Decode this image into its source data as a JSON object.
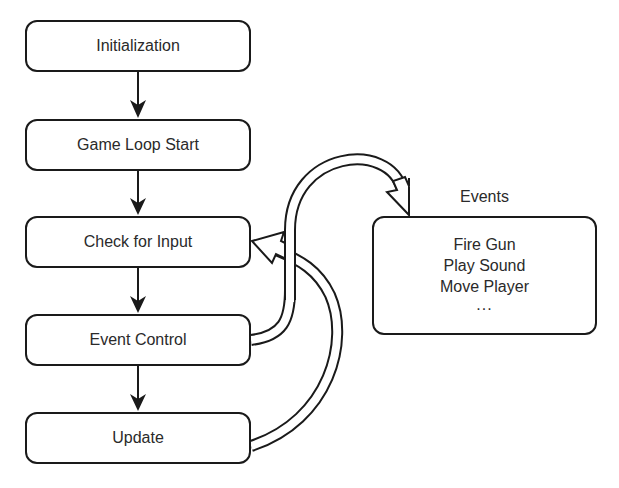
{
  "diagram": {
    "type": "flowchart",
    "nodes": {
      "initialization": "Initialization",
      "game_loop_start": "Game Loop Start",
      "check_for_input": "Check for Input",
      "event_control": "Event Control",
      "update": "Update"
    },
    "events_panel": {
      "title": "Events",
      "items": [
        "Fire Gun",
        "Play Sound",
        "Move Player",
        "..."
      ]
    },
    "edges": [
      {
        "from": "Initialization",
        "to": "Game Loop Start",
        "style": "solid-arrow"
      },
      {
        "from": "Game Loop Start",
        "to": "Check for Input",
        "style": "solid-arrow"
      },
      {
        "from": "Check for Input",
        "to": "Event Control",
        "style": "solid-arrow"
      },
      {
        "from": "Event Control",
        "to": "Update",
        "style": "solid-arrow"
      },
      {
        "from": "Event Control",
        "to": "Events",
        "style": "hollow-curved-arrow"
      },
      {
        "from": "Update",
        "to": "Check for Input",
        "style": "hollow-curved-arrow"
      }
    ],
    "colors": {
      "stroke": "#1a1a1a",
      "text": "#2a2a2a",
      "background": "#ffffff"
    }
  }
}
